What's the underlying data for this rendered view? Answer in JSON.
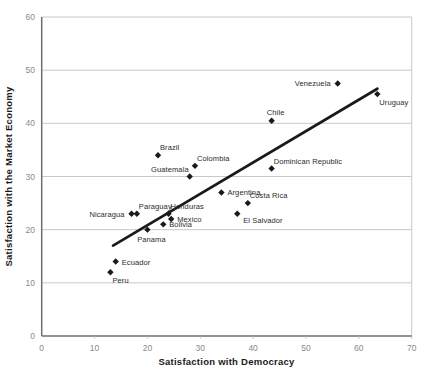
{
  "chart_data": {
    "type": "scatter",
    "title": "",
    "xlabel": "Satisfaction with Democracy",
    "ylabel": "Satisfaction with the Market Economy",
    "xlim": [
      0,
      70
    ],
    "ylim": [
      0,
      60
    ],
    "xticks": [
      0,
      10,
      20,
      30,
      40,
      50,
      60,
      70
    ],
    "yticks": [
      0,
      10,
      20,
      30,
      40,
      50,
      60
    ],
    "grid": "horizontal-only",
    "legend": "none",
    "marker": "diamond",
    "points": [
      {
        "label": "Peru",
        "x": 13,
        "y": 12,
        "label_pos": "below-right"
      },
      {
        "label": "Ecuador",
        "x": 14,
        "y": 14,
        "label_pos": "right"
      },
      {
        "label": "Nicaragua",
        "x": 17,
        "y": 23,
        "label_pos": "left"
      },
      {
        "label": "Paraguay",
        "x": 18,
        "y": 23,
        "label_pos": "above-right"
      },
      {
        "label": "Panama",
        "x": 20,
        "y": 20,
        "label_pos": "below"
      },
      {
        "label": "Bolivia",
        "x": 23,
        "y": 21,
        "label_pos": "right"
      },
      {
        "label": "Honduras",
        "x": 24,
        "y": 23,
        "label_pos": "above-right"
      },
      {
        "label": "Mexico",
        "x": 24.5,
        "y": 22,
        "label_pos": "right"
      },
      {
        "label": "Brazil",
        "x": 22,
        "y": 34,
        "label_pos": "above-right"
      },
      {
        "label": "Guatemala",
        "x": 28,
        "y": 30,
        "label_pos": "above-left"
      },
      {
        "label": "Colombia",
        "x": 29,
        "y": 32,
        "label_pos": "above-right"
      },
      {
        "label": "Argentina",
        "x": 34,
        "y": 27,
        "label_pos": "right"
      },
      {
        "label": "El Salvador",
        "x": 37,
        "y": 23,
        "label_pos": "right-below"
      },
      {
        "label": "Costa Rica",
        "x": 39,
        "y": 25,
        "label_pos": "above-right"
      },
      {
        "label": "Dominican Republic",
        "x": 43.5,
        "y": 31.5,
        "label_pos": "above-right"
      },
      {
        "label": "Chile",
        "x": 43.5,
        "y": 40.5,
        "label_pos": "above"
      },
      {
        "label": "Venezuela",
        "x": 56,
        "y": 47.5,
        "label_pos": "left"
      },
      {
        "label": "Uruguay",
        "x": 63.5,
        "y": 45.5,
        "label_pos": "below-right"
      }
    ],
    "trend_line": {
      "type": "linear",
      "x1": 13.5,
      "y1": 17,
      "x2": 63.5,
      "y2": 46.5
    },
    "colors": {
      "marker": "#1a1a1a",
      "trend_line": "#1a1a1a",
      "gridline": "#c9c9c9",
      "frame_line": "#c9c9c9",
      "axis_line": "#6e6e6e",
      "tick_mark": "#b8b8b8",
      "tick_label": "#8a8a8a",
      "country_label": "#2b2b2b",
      "axis_title": "#1a1a1a",
      "background": "#ffffff"
    }
  }
}
